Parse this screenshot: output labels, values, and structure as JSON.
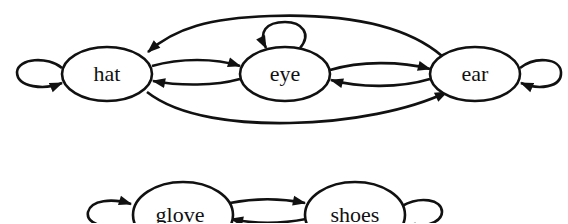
{
  "diagram": {
    "type": "state-transition-graph",
    "colors": {
      "stroke": "#111111",
      "background": "#ffffff",
      "node_fill": "#ffffff"
    },
    "nodes": [
      {
        "id": "hat",
        "label": "hat"
      },
      {
        "id": "eye",
        "label": "eye"
      },
      {
        "id": "ear",
        "label": "ear"
      },
      {
        "id": "glove",
        "label": "glove"
      },
      {
        "id": "shoes",
        "label": "shoes"
      }
    ],
    "edges": [
      {
        "from": "hat",
        "to": "hat",
        "kind": "self-loop"
      },
      {
        "from": "eye",
        "to": "eye",
        "kind": "self-loop"
      },
      {
        "from": "ear",
        "to": "ear",
        "kind": "self-loop"
      },
      {
        "from": "hat",
        "to": "eye"
      },
      {
        "from": "eye",
        "to": "hat"
      },
      {
        "from": "eye",
        "to": "ear"
      },
      {
        "from": "ear",
        "to": "eye"
      },
      {
        "from": "ear",
        "to": "hat",
        "kind": "outer-arc-top"
      },
      {
        "from": "hat",
        "to": "ear",
        "kind": "outer-arc-bottom"
      },
      {
        "from": "glove",
        "to": "glove",
        "kind": "self-loop"
      },
      {
        "from": "shoes",
        "to": "shoes",
        "kind": "self-loop"
      },
      {
        "from": "glove",
        "to": "shoes"
      },
      {
        "from": "shoes",
        "to": "glove"
      }
    ],
    "components": [
      [
        "hat",
        "eye",
        "ear"
      ],
      [
        "glove",
        "shoes"
      ]
    ]
  }
}
